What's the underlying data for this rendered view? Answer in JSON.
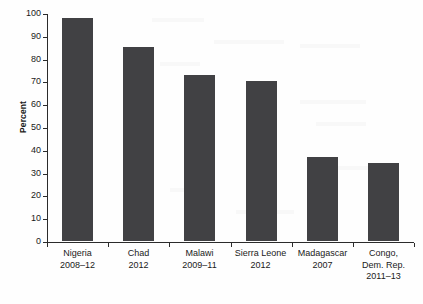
{
  "chart_data": {
    "type": "bar",
    "title": "",
    "xlabel": "",
    "ylabel": "Percent",
    "ylim": [
      0,
      100
    ],
    "ytick_step": 10,
    "grid": false,
    "legend": "none",
    "bar_color": "#414144",
    "axis_color": "#2b2b2b",
    "background_color": "#fefefe",
    "categories": [
      "Nigeria 2008–12",
      "Chad 2012",
      "Malawi 2009–11",
      "Sierra Leone 2012",
      "Madagascar 2007",
      "Congo, Dem. Rep. 2011–13"
    ],
    "values": [
      98,
      85,
      73,
      70,
      37,
      34
    ],
    "yticks": [
      "0",
      "10",
      "20",
      "30",
      "40",
      "50",
      "60",
      "70",
      "80",
      "90",
      "100"
    ],
    "category_labels": [
      {
        "lines": [
          "Nigeria",
          "2008–12"
        ]
      },
      {
        "lines": [
          "Chad",
          "2012"
        ]
      },
      {
        "lines": [
          "Malawi",
          "2009–11"
        ]
      },
      {
        "lines": [
          "Sierra Leone",
          "2012"
        ]
      },
      {
        "lines": [
          "Madagascar",
          "2007"
        ]
      },
      {
        "lines": [
          "Congo,",
          "Dem. Rep.",
          "2011–13"
        ]
      }
    ]
  }
}
